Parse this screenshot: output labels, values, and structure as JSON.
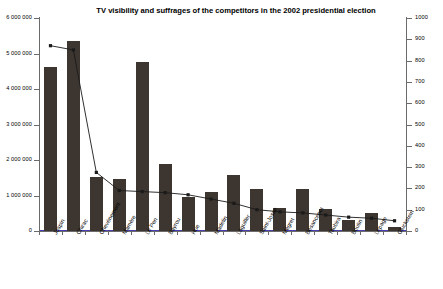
{
  "chart_data": {
    "type": "bar",
    "title": "TV visibility and suffrages of the competitors in the 2002 presidential election",
    "xlabel": "",
    "ylabel": "",
    "grid": false,
    "legend": "none",
    "categories": [
      "Jospin",
      "Chirac",
      "Chevènement",
      "Mamère",
      "Le Pen",
      "Bayrou",
      "Hue",
      "Madelin",
      "Laguiller",
      "Saint-Josse",
      "Mégret",
      "Besancenot",
      "Taubira",
      "Boutin",
      "Lepage",
      "Gluckstein"
    ],
    "series": [
      {
        "name": "TV visibility",
        "type": "bar",
        "axis": "left",
        "values": [
          4630000,
          5350000,
          1510000,
          1470000,
          4770000,
          1900000,
          950000,
          1090000,
          1580000,
          1180000,
          650000,
          1180000,
          620000,
          300000,
          500000,
          100000
        ]
      },
      {
        "name": "Suffrages",
        "type": "line",
        "axis": "right",
        "values": [
          870,
          850,
          275,
          190,
          185,
          180,
          170,
          150,
          130,
          100,
          90,
          85,
          75,
          65,
          60,
          48
        ]
      }
    ],
    "left_axis": {
      "min": 0,
      "max": 6000000,
      "step": 1000000,
      "ticks": [
        "0",
        "1 000 000",
        "2 000 000",
        "3 000 000",
        "4 000 000",
        "5 000 000",
        "6 000 000"
      ]
    },
    "right_axis": {
      "min": 0,
      "max": 1000,
      "step": 100,
      "ticks": [
        "0",
        "100",
        "200",
        "300",
        "400",
        "500",
        "600",
        "700",
        "800",
        "900",
        "1000"
      ]
    },
    "colors": {
      "bar": "#3d3630",
      "line": "#1a1a1a",
      "axis": "#6b6b6b",
      "baseline_accent": "#4a3fb0",
      "background": "#ffffff"
    }
  }
}
